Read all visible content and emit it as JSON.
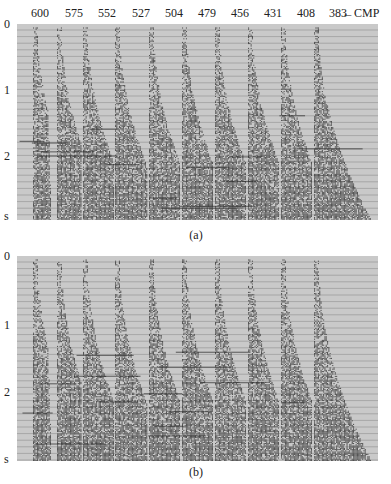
{
  "figure": {
    "cmp_axis_label": "CMP",
    "cmp_numbers": [
      "600",
      "575",
      "552",
      "527",
      "504",
      "479",
      "456",
      "431",
      "408",
      "383"
    ],
    "time_unit": "s",
    "time_ticks": [
      "0",
      "1",
      "2"
    ],
    "panels": [
      {
        "id": "a",
        "caption": "(a)"
      },
      {
        "id": "b",
        "caption": "(b)"
      }
    ],
    "colors": {
      "background": "#c9c9c9",
      "trace": "#3a3a3a",
      "gridline": "#8e8e8e"
    }
  }
}
